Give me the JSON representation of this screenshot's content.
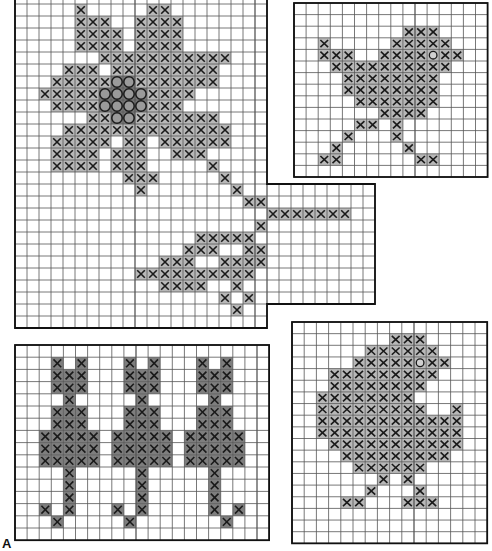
{
  "figure_label": "A",
  "colors": {
    "grid_line": "#555555",
    "border": "#111111",
    "cross_fill": "#b8b8b8",
    "dark_fill": "#7e7e7e",
    "circle_fill": "#9a9a9a",
    "mark": "#1a1a1a"
  },
  "panels": [
    {
      "name": "flower-chart",
      "x": 15,
      "y": -8,
      "cell_w": 12,
      "cell_h": 12,
      "cols": 21,
      "rows": 28,
      "extension": {
        "col_start": 21,
        "cols": 9,
        "row_start": 16,
        "rows": 10
      },
      "fill": "cross_fill",
      "crosses": {
        "1": [
          5,
          11,
          12
        ],
        "2": [
          5,
          6,
          7,
          10,
          11,
          12,
          13
        ],
        "3": [
          5,
          6,
          7,
          8,
          10,
          11,
          12,
          13
        ],
        "4": [
          5,
          6,
          7,
          8,
          10,
          11,
          12,
          13
        ],
        "5": [
          7,
          8,
          9,
          10,
          11,
          12,
          13,
          14,
          15,
          16,
          17
        ],
        "6": [
          4,
          5,
          6,
          8,
          9,
          10,
          11,
          12,
          13,
          14,
          15,
          16
        ],
        "7": [
          3,
          4,
          5,
          6,
          7,
          10,
          11,
          12,
          13,
          14,
          15,
          16
        ],
        "8": [
          2,
          3,
          4,
          5,
          6,
          11,
          12,
          13,
          14
        ],
        "9": [
          3,
          4,
          5,
          6,
          11,
          12,
          13
        ],
        "10": [
          6,
          7,
          10,
          11,
          12,
          13,
          14,
          15,
          16
        ],
        "11": [
          4,
          5,
          6,
          7,
          8,
          9,
          10,
          11,
          12,
          13,
          14,
          15,
          16,
          17
        ],
        "12": [
          3,
          4,
          5,
          6,
          7,
          9,
          10,
          12,
          13,
          14,
          15,
          16,
          17
        ],
        "13": [
          3,
          4,
          5,
          6,
          8,
          9,
          10,
          13,
          14,
          15
        ],
        "14": [
          3,
          4,
          5,
          6,
          8,
          9,
          10,
          16
        ],
        "15": [
          9,
          10,
          11,
          17
        ],
        "16": [
          10,
          18
        ],
        "17": [
          19,
          20
        ],
        "18": [
          21,
          22,
          23,
          24,
          25,
          26,
          27
        ],
        "19": [
          20
        ],
        "20": [
          15,
          16,
          17,
          18,
          19
        ],
        "21": [
          14,
          15,
          16,
          19,
          20
        ],
        "22": [
          12,
          13,
          14,
          17,
          18,
          19,
          20
        ],
        "23": [
          10,
          11,
          12,
          13,
          14,
          15,
          16,
          17,
          18,
          19
        ],
        "24": [
          12,
          13,
          14,
          15,
          18
        ],
        "25": [
          17,
          19
        ],
        "26": [
          18
        ]
      },
      "circles": {
        "7": [
          8,
          9
        ],
        "8": [
          7,
          8,
          9,
          10
        ],
        "9": [
          7,
          8,
          9,
          10
        ],
        "10": [
          8,
          9
        ]
      }
    },
    {
      "name": "bird-chart",
      "x": 294,
      "y": 3,
      "cell_w": 12.1,
      "cell_h": 11.6,
      "cols": 16,
      "rows": 15,
      "fill": "cross_fill",
      "crosses": {
        "2": [
          9,
          10,
          11
        ],
        "3": [
          2,
          8,
          9,
          10,
          11,
          12
        ],
        "4": [
          2,
          3,
          4,
          7,
          8,
          9,
          10,
          12,
          13
        ],
        "5": [
          3,
          4,
          5,
          6,
          7,
          8,
          9,
          10,
          11,
          12
        ],
        "6": [
          4,
          5,
          6,
          7,
          8,
          9,
          10,
          11
        ],
        "7": [
          4,
          5,
          6,
          7,
          8,
          9,
          10,
          11
        ],
        "8": [
          5,
          6,
          7,
          8,
          9,
          10,
          11
        ],
        "9": [
          7,
          8,
          9,
          10
        ],
        "10": [
          5,
          6,
          8
        ],
        "11": [
          4,
          8
        ],
        "12": [
          3,
          9
        ],
        "13": [
          2,
          3,
          10,
          11
        ]
      },
      "eyes": {
        "4": [
          11
        ]
      }
    },
    {
      "name": "cats-chart",
      "x": 15,
      "y": 345,
      "cell_w": 12.1,
      "cell_h": 12.2,
      "cols": 21,
      "rows": 16,
      "fill": "dark_fill",
      "crosses": {
        "1": [
          3,
          5,
          9,
          11,
          15,
          17
        ],
        "2": [
          3,
          4,
          5,
          9,
          10,
          11,
          15,
          16,
          17
        ],
        "3": [
          3,
          4,
          5,
          9,
          10,
          11,
          15,
          16,
          17
        ],
        "4": [
          4,
          10,
          16
        ],
        "5": [
          3,
          4,
          5,
          9,
          10,
          11,
          15,
          16,
          17
        ],
        "6": [
          3,
          4,
          5,
          9,
          10,
          11,
          15,
          16,
          17
        ],
        "7": [
          2,
          3,
          4,
          5,
          6,
          8,
          9,
          10,
          11,
          12,
          14,
          15,
          16,
          17,
          18
        ],
        "8": [
          2,
          3,
          4,
          5,
          6,
          8,
          9,
          10,
          11,
          12,
          14,
          15,
          16,
          17,
          18
        ],
        "9": [
          2,
          3,
          4,
          5,
          6,
          8,
          9,
          10,
          11,
          12,
          14,
          15,
          16,
          17,
          18
        ],
        "10": [
          4,
          10,
          16
        ],
        "11": [
          4,
          10,
          16
        ],
        "12": [
          4,
          10,
          16
        ],
        "13": [
          2,
          4,
          8,
          10,
          16,
          18
        ],
        "14": [
          3,
          9,
          17
        ]
      }
    },
    {
      "name": "chick-chart",
      "x": 292,
      "y": 322,
      "cell_w": 12.2,
      "cell_h": 11.65,
      "cols": 16,
      "rows": 19,
      "fill": "cross_fill",
      "crosses": {
        "1": [
          8,
          9,
          10
        ],
        "2": [
          6,
          7,
          8,
          9,
          10,
          11
        ],
        "3": [
          5,
          6,
          7,
          8,
          9,
          11,
          12
        ],
        "4": [
          3,
          4,
          5,
          6,
          7,
          8,
          9,
          10,
          11
        ],
        "5": [
          3,
          4,
          5,
          6,
          7,
          8,
          9,
          10
        ],
        "6": [
          2,
          3,
          4,
          5,
          6,
          7,
          8,
          9
        ],
        "7": [
          2,
          3,
          4,
          5,
          6,
          7,
          8,
          9,
          10,
          13
        ],
        "8": [
          2,
          3,
          4,
          5,
          6,
          7,
          8,
          9,
          10,
          11,
          12,
          13
        ],
        "9": [
          2,
          3,
          4,
          5,
          6,
          7,
          8,
          9,
          10,
          11,
          12,
          13
        ],
        "10": [
          3,
          4,
          5,
          6,
          7,
          8,
          9,
          10,
          11,
          12,
          13
        ],
        "11": [
          4,
          5,
          6,
          7,
          8,
          9,
          10,
          11,
          12
        ],
        "12": [
          5,
          6,
          7,
          8,
          9,
          10
        ],
        "13": [
          7,
          9
        ],
        "14": [
          6,
          10
        ],
        "15": [
          4,
          5,
          9,
          10,
          11
        ]
      },
      "eyes": {
        "3": [
          10
        ]
      }
    }
  ]
}
